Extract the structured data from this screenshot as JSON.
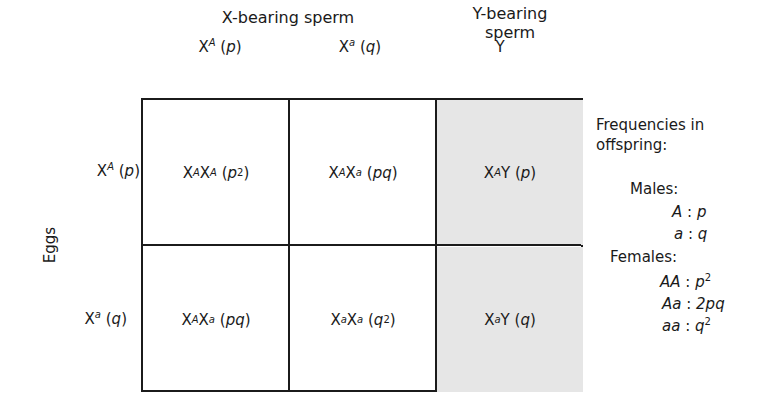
{
  "columns": {
    "x_group_label": "X-bearing sperm",
    "y_group_label_line1": "Y-bearing",
    "y_group_label_line2": "sperm",
    "headers": [
      {
        "base": "X",
        "sup": "A",
        "freq": "p"
      },
      {
        "base": "X",
        "sup": "a",
        "freq": "q"
      },
      {
        "base": "Y",
        "sup": "",
        "freq": ""
      }
    ]
  },
  "rows": {
    "group_label": "Eggs",
    "headers": [
      {
        "base": "X",
        "sup": "A",
        "freq": "p"
      },
      {
        "base": "X",
        "sup": "a",
        "freq": "q"
      }
    ]
  },
  "cells": [
    [
      {
        "g1": "X",
        "s1": "A",
        "g2": "X",
        "s2": "A",
        "f": "p",
        "fsup": "2",
        "shaded": false
      },
      {
        "g1": "X",
        "s1": "A",
        "g2": "X",
        "s2": "a",
        "f": "pq",
        "fsup": "",
        "shaded": false
      },
      {
        "g1": "X",
        "s1": "A",
        "g2": "Y",
        "s2": "",
        "f": "p",
        "fsup": "",
        "shaded": true
      }
    ],
    [
      {
        "g1": "X",
        "s1": "A",
        "g2": "X",
        "s2": "a",
        "f": "pq",
        "fsup": "",
        "shaded": false
      },
      {
        "g1": "X",
        "s1": "a",
        "g2": "X",
        "s2": "a",
        "f": "q",
        "fsup": "2",
        "shaded": false
      },
      {
        "g1": "X",
        "s1": "a",
        "g2": "Y",
        "s2": "",
        "f": "q",
        "fsup": "",
        "shaded": true
      }
    ]
  ],
  "legend": {
    "title_line1": "Frequencies in",
    "title_line2": "offspring:",
    "males_label": "Males:",
    "males": [
      {
        "genotype": "A",
        "sep": ":",
        "freq": "p",
        "sup": ""
      },
      {
        "genotype": "a",
        "sep": ":",
        "freq": "q",
        "sup": ""
      }
    ],
    "females_label": "Females:",
    "females": [
      {
        "genotype": "AA",
        "sep": ":",
        "freq": "p",
        "sup": "2"
      },
      {
        "genotype": "Aa",
        "sep": ":",
        "freq": "2pq",
        "sup": ""
      },
      {
        "genotype": "aa",
        "sep": ":",
        "freq": "q",
        "sup": "2"
      }
    ]
  },
  "colors": {
    "border": "#1b1b1b",
    "shaded_cell": "#e6e6e6",
    "background": "#ffffff"
  }
}
